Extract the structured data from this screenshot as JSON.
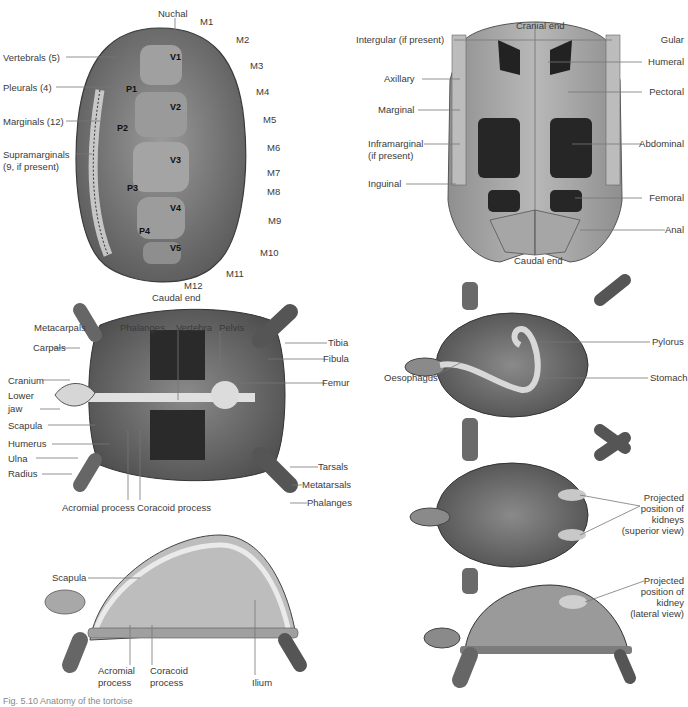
{
  "figure": {
    "caption": "Fig. 5.10 Anatomy of the tortoise",
    "panels": {
      "carapace": {
        "top_label": "Nuchal",
        "bottom_label": "Caudal end",
        "left_labels": [
          "Vertebrals (5)",
          "Pleurals (4)",
          "Marginals (12)",
          "Supramarginals",
          "(9, if present)"
        ],
        "marginals": [
          "M1",
          "M2",
          "M3",
          "M4",
          "M5",
          "M6",
          "M7",
          "M8",
          "M9",
          "M10",
          "M11",
          "M12"
        ],
        "vertebrals": [
          "V1",
          "V2",
          "V3",
          "V4",
          "V5"
        ],
        "pleurals": [
          "P1",
          "P2",
          "P3",
          "P4"
        ]
      },
      "plastron": {
        "top_label": "Cranial end",
        "bottom_label": "Caudal end",
        "left_labels": [
          "Intergular (if present)",
          "Axillary",
          "Marginal",
          "Inframarginal",
          "(if present)",
          "Inguinal"
        ],
        "right_labels": [
          "Gular",
          "Humeral",
          "Pectoral",
          "Abdominal",
          "Femoral",
          "Anal"
        ]
      },
      "skeleton_ventral": {
        "top_labels": [
          "Metacarpals",
          "Phalanges",
          "Vertebra",
          "Pelvis"
        ],
        "left_labels": [
          "Carpals",
          "Cranium",
          "Lower",
          "jaw",
          "Scapula",
          "Humerus",
          "Ulna",
          "Radius"
        ],
        "bottom_labels": [
          "Acromial process",
          "Coracoid process"
        ],
        "right_labels": [
          "Tibia",
          "Fibula",
          "Femur",
          "Tarsals",
          "Metatarsals",
          "Phalanges"
        ]
      },
      "skeleton_lateral": {
        "labels": [
          "Scapula",
          "Acromial",
          "process",
          "Coracoid",
          "process",
          "Ilium"
        ]
      },
      "digestive": {
        "labels": [
          "Pylorus",
          "Oesophagus",
          "Stomach"
        ]
      },
      "kidney_superior": {
        "label_lines": [
          "Projected",
          "position of",
          "kidneys",
          "(superior view)"
        ]
      },
      "kidney_lateral": {
        "label_lines": [
          "Projected",
          "position of",
          "kidney",
          "(lateral view)"
        ]
      }
    },
    "colors": {
      "shell_dark": "#4a4a4a",
      "shell_mid": "#8a8a8a",
      "shell_light": "#c4c4c4",
      "bone": "#e4e4e4",
      "label_text": "#3a3a3a",
      "leader_line": "#777777"
    }
  }
}
